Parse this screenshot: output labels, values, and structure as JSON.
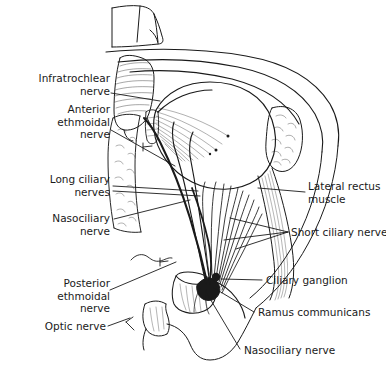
{
  "figure": {
    "type": "anatomical-line-diagram",
    "style": "black-and-white pen-and-ink line drawing",
    "background_color": "#ffffff",
    "line_color": "#1a1a1a"
  },
  "labels": {
    "infratrochlear_nerve": "Infratrochlear\nnerve",
    "anterior_ethmoidal_nerve": "Anterior\nethmoidal\nnerve",
    "long_ciliary_nerves": "Long ciliary\nnerves",
    "nasociliary_nerve_left": "Nasociliary\nnerve",
    "posterior_ethmoidal_nerve": "Posterior\nethmoidal\nnerve",
    "optic_nerve": "Optic nerve",
    "lateral_rectus_muscle": "Lateral rectus\nmuscle",
    "short_ciliary_nerves": "Short ciliary nerves",
    "ciliary_ganglion": "Ciliary ganglion",
    "ramus_communicans": "Ramus communicans",
    "nasociliary_nerve_right": "Nasociliary nerve"
  },
  "structures": [
    "trochlea",
    "superior oblique muscle",
    "orbital roof",
    "globe of eye",
    "lacrimal gland",
    "lateral rectus muscle",
    "medial orbital wall",
    "ethmoid bone",
    "optic nerve stump",
    "ciliary ganglion",
    "short ciliary nerves",
    "long ciliary nerves",
    "orbital floor"
  ]
}
